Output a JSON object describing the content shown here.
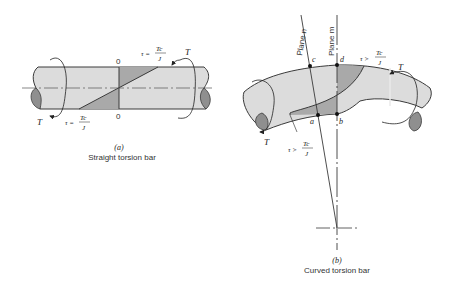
{
  "figure_a": {
    "tag": "(a)",
    "caption": "Straight torsion bar",
    "section_label_top": "0",
    "section_label_bottom": "0",
    "torque_left": "T",
    "torque_right": "T",
    "stress_top": {
      "lhs": "τ =",
      "num": "Tc",
      "den": "J"
    },
    "stress_bottom": {
      "lhs": "τ =",
      "num": "Tc",
      "den": "J"
    }
  },
  "figure_b": {
    "tag": "(b)",
    "caption": "Curved torsion bar",
    "plane_n": "Plane n",
    "plane_m": "Plane m",
    "points": {
      "a": "a",
      "b": "b",
      "c": "c",
      "d": "d"
    },
    "torque_left": "T",
    "torque_right": "T",
    "stress_top": {
      "lhs": "τ >",
      "num": "Tc",
      "den": "J"
    },
    "stress_bottom": {
      "lhs": "τ >",
      "num": "Tc",
      "den": "J"
    }
  },
  "colors": {
    "bar_fill": "#dcdcdc",
    "stress_fill": "#a9a9a9",
    "end_fill": "#8f8f8f",
    "stroke": "#3a3a3a"
  }
}
